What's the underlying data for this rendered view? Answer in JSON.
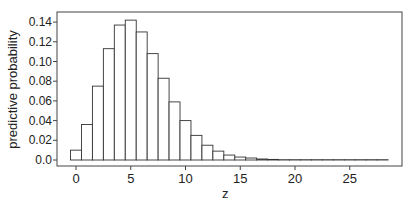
{
  "chart_data": {
    "type": "bar",
    "title": "",
    "xlabel": "z",
    "ylabel": "predictive probability",
    "x": [
      0,
      1,
      2,
      3,
      4,
      5,
      6,
      7,
      8,
      9,
      10,
      11,
      12,
      13,
      14,
      15,
      16,
      17,
      18,
      19,
      20,
      21,
      22,
      23,
      24,
      25,
      26,
      27,
      28
    ],
    "values": [
      0.01,
      0.036,
      0.075,
      0.113,
      0.137,
      0.142,
      0.13,
      0.108,
      0.083,
      0.059,
      0.04,
      0.025,
      0.015,
      0.009,
      0.005,
      0.003,
      0.002,
      0.001,
      0.0006,
      0.0003,
      0.0002,
      0.0001,
      0.0001,
      5e-05,
      3e-05,
      2e-05,
      1e-05,
      1e-05,
      1e-05
    ],
    "xticks": [
      0,
      5,
      10,
      15,
      20,
      25
    ],
    "xtick_labels": [
      "0",
      "5",
      "10",
      "15",
      "20",
      "25"
    ],
    "yticks": [
      0.0,
      0.02,
      0.04,
      0.06,
      0.08,
      0.1,
      0.12,
      0.14
    ],
    "ytick_labels": [
      "0.0",
      "0.02",
      "0.04",
      "0.06",
      "0.08",
      "0.10",
      "0.12",
      "0.14"
    ],
    "xlim": [
      -2.0,
      29.7
    ],
    "ylim": [
      -0.004,
      0.149
    ],
    "grid": false,
    "legend": null,
    "bar_fill": "#ffffff",
    "bar_stroke": "#333333"
  },
  "labels": {
    "x_axis": "z",
    "y_axis": "predictive probability"
  }
}
